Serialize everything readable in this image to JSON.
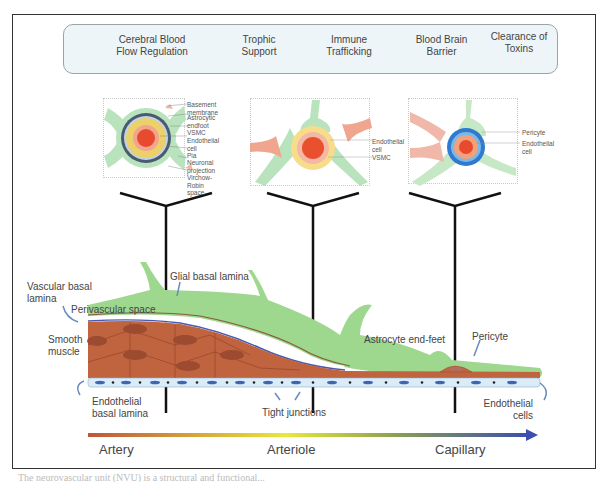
{
  "functions": [
    {
      "label_line1": "Cerebral Blood",
      "label_line2": "Flow Regulation"
    },
    {
      "label_line1": "Trophic",
      "label_line2": "Support"
    },
    {
      "label_line1": "Immune",
      "label_line2": "Trafficking"
    },
    {
      "label_line1": "Blood Brain",
      "label_line2": "Barrier"
    },
    {
      "label_line1": "Clearance of",
      "label_line2": "Toxins"
    }
  ],
  "panels": {
    "artery": {
      "labels": [
        "Basement membrane",
        "Astrocytic endfoot",
        "VSMC",
        "Endothelial cell",
        "Pia",
        "Neuronal projection",
        "Virchow-Robin space"
      ],
      "lumen_label": "Lumen"
    },
    "arteriole": {
      "labels": [
        "Endothelial cell",
        "VSMC"
      ]
    },
    "capillary": {
      "labels": [
        "Pericyte",
        "Endothelial cell"
      ]
    }
  },
  "vessel_labels": {
    "vascular_basal_lamina": "Vascular basal lamina",
    "glial_basal_lamina": "Glial basal lamina",
    "perivascular_space": "Perivascular space",
    "smooth_muscle": "Smooth muscle",
    "astrocyte_end_feet": "Astrocyte end-feet",
    "pericyte": "Pericyte",
    "endothelial_basal_lamina": "Endothelial basal lamina",
    "tight_junctions": "Tight junctions",
    "endothelial_cells": "Endothelial cells"
  },
  "axis": {
    "artery": "Artery",
    "arteriole": "Arteriole",
    "capillary": "Capillary",
    "gradient_colors": [
      "#c0553a",
      "#e8e838",
      "#3a4fb0"
    ]
  },
  "colors": {
    "astrocyte_green": "#9ed78e",
    "smooth_muscle": "#c0643f",
    "endothelium": "#dcecf6",
    "nucleus_blue": "#3f64b4",
    "panel_bg": "#eef5f8"
  },
  "caption": "The neurovascular unit (NVU) is a structural and functional..."
}
